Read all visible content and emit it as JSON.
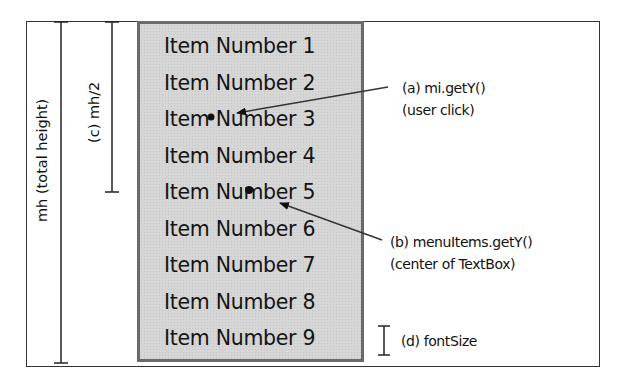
{
  "menu": {
    "items": [
      {
        "label": "Item Number 1"
      },
      {
        "label": "Item Number 2"
      },
      {
        "label": "Item Number 3"
      },
      {
        "label": "Item Number 4"
      },
      {
        "label": "Item Number 5"
      },
      {
        "label": "Item Number 6"
      },
      {
        "label": "Item Number 7"
      },
      {
        "label": "Item Number 8"
      },
      {
        "label": "Item Number 9"
      }
    ],
    "fill_color": "#d6d6d6",
    "border_color": "#6a6a6a"
  },
  "dimensions": {
    "total_height_label": "mh (total height)",
    "half_height_label": "(c) mh/2"
  },
  "annotations": {
    "a": {
      "line1": "(a) mi.getY()",
      "line2": "(user click)"
    },
    "b": {
      "line1": "(b) menuItems.getY()",
      "line2": "(center of TextBox)"
    },
    "d": {
      "label": "(d) fontSize"
    }
  }
}
